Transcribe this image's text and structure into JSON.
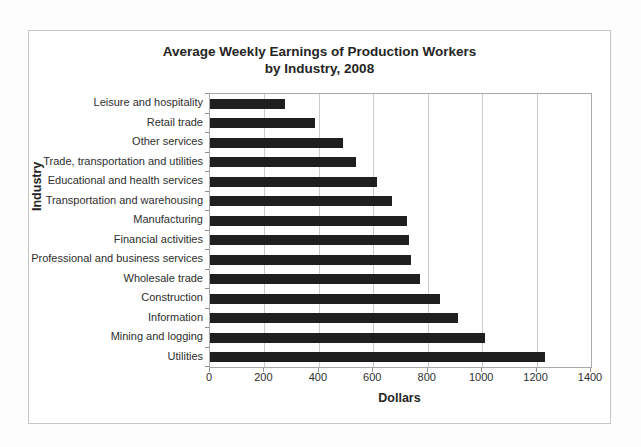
{
  "figure": {
    "background_color": "#ffffff",
    "border_color": "#c6c6c6"
  },
  "chart_data": {
    "type": "bar",
    "orientation": "horizontal",
    "title": "Average Weekly Earnings of Production Workers",
    "subtitle": "by Industry, 2008",
    "xlabel": "Dollars",
    "ylabel": "Industry",
    "categories": [
      "Leisure and hospitality",
      "Retail trade",
      "Other services",
      "Trade,  transportation and utilities",
      "Educational and health services",
      "Transportation and warehousing",
      "Manufacturing",
      "Financial activities",
      "Professional and business services",
      "Wholesale trade",
      "Construction",
      "Information",
      "Mining and logging",
      "Utilities"
    ],
    "values": [
      275,
      385,
      490,
      535,
      615,
      670,
      725,
      730,
      740,
      770,
      845,
      910,
      1010,
      1230
    ],
    "x_ticks": [
      0,
      200,
      400,
      600,
      800,
      1000,
      1200,
      1400
    ],
    "xlim": [
      0,
      1400
    ],
    "grid": "vertical",
    "legend": "none",
    "bar_color": "#1f1f1f",
    "gridline_color": "#cbcbcb"
  }
}
